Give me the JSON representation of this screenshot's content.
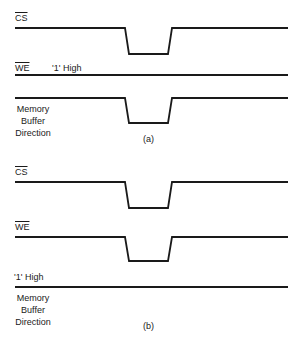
{
  "panel_a": {
    "caption": "(a)",
    "signals": [
      {
        "name": "CS",
        "overbar": true,
        "note": "",
        "waveform": "pulse-low"
      },
      {
        "name": "WE",
        "overbar": true,
        "note": "'1' High",
        "waveform": "constant-high"
      },
      {
        "name": "Memory Buffer Direction",
        "lines": [
          "Memory",
          "Buffer",
          "Direction"
        ],
        "overbar": false,
        "waveform": "pulse-low"
      }
    ],
    "labels": {
      "cs": "CS",
      "we": "WE",
      "we_note": "'1' High",
      "mbd_1": "Memory",
      "mbd_2": "Buffer",
      "mbd_3": "Direction"
    }
  },
  "panel_b": {
    "caption": "(b)",
    "signals": [
      {
        "name": "CS",
        "overbar": true,
        "note": "",
        "waveform": "pulse-low"
      },
      {
        "name": "WE",
        "overbar": true,
        "note": "",
        "waveform": "pulse-low"
      },
      {
        "name": "Memory Buffer Direction",
        "lines": [
          "Memory",
          "Buffer",
          "Direction"
        ],
        "overbar": false,
        "note": "'1' High",
        "waveform": "constant-high"
      }
    ],
    "labels": {
      "cs": "CS",
      "we": "WE",
      "mbd_note": "'1' High",
      "mbd_1": "Memory",
      "mbd_2": "Buffer",
      "mbd_3": "Direction"
    }
  },
  "colors": {
    "line": "#1a1a1a",
    "background": "#ffffff"
  }
}
